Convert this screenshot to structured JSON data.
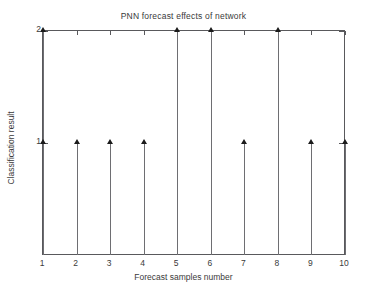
{
  "chart_data": {
    "type": "bar",
    "subtype": "stem",
    "title": "PNN forecast effects of network",
    "xlabel": "Forecast samples number",
    "ylabel": "Classification result",
    "categories": [
      1,
      2,
      3,
      4,
      5,
      6,
      7,
      8,
      9,
      10
    ],
    "x": [
      1,
      2,
      3,
      4,
      5,
      6,
      7,
      8,
      9,
      10
    ],
    "values": [
      2,
      1,
      1,
      1,
      2,
      2,
      1,
      2,
      1,
      1
    ],
    "series": [
      {
        "name": "Classification result",
        "values": [
          2,
          1,
          1,
          1,
          2,
          2,
          1,
          2,
          1,
          1
        ]
      }
    ],
    "xtick_labels": [
      "1",
      "2",
      "3",
      "4",
      "5",
      "6",
      "7",
      "8",
      "9",
      "10"
    ],
    "ytick_labels": [
      "1",
      "2"
    ],
    "yticks": [
      1,
      2
    ],
    "xlim": [
      1,
      10
    ],
    "ylim": [
      0,
      2
    ],
    "grid": false,
    "legend": false,
    "legend_position": "none",
    "marker": "triangle-up",
    "colors": {
      "line": "#6e6e72",
      "marker": "#1b1b1b",
      "axis": "#59595c",
      "text": "#3a3a3a",
      "background": "#ffffff"
    }
  }
}
